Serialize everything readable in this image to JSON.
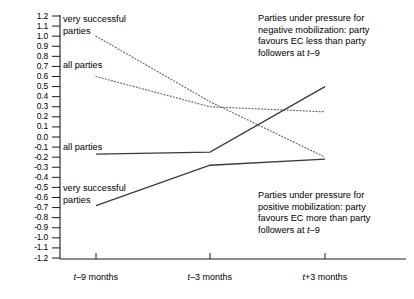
{
  "chart_data": {
    "type": "line",
    "title": "",
    "xlabel": "",
    "ylabel": "",
    "x": [
      "t–9 months",
      "t–3 months",
      "t+3 months"
    ],
    "ylim": [
      -1.2,
      1.2
    ],
    "ytick_step": 0.1,
    "grid": false,
    "legend": "inline-labels",
    "yticks": [
      "1.2",
      "1.1",
      "1.0",
      "0.9",
      "0.8",
      "0.7",
      "0.6",
      "0.5",
      "0.4",
      "0.3",
      "0.2",
      "0.1",
      "0.0",
      "-0.1",
      "-0.2",
      "-0.3",
      "-0.4",
      "-0.5",
      "-0.6",
      "-0.7",
      "-0.8",
      "-0.9",
      "-1.0",
      "-1.1",
      "-1.2"
    ],
    "series": [
      {
        "name": "very successful parties (negative mobilization)",
        "style": "dotted",
        "values": [
          1.0,
          0.35,
          -0.2
        ]
      },
      {
        "name": "all parties (negative mobilization)",
        "style": "dotted",
        "values": [
          0.6,
          0.3,
          0.25
        ]
      },
      {
        "name": "all parties (positive mobilization)",
        "style": "solid",
        "values": [
          -0.17,
          -0.15,
          0.5
        ]
      },
      {
        "name": "very successful parties (positive mobilization)",
        "style": "solid",
        "values": [
          -0.68,
          -0.28,
          -0.22
        ]
      }
    ]
  },
  "axis": {
    "y_labels": [
      "1.2",
      "1.1",
      "1.0",
      "0.9",
      "0.8",
      "0.7",
      "0.6",
      "0.5",
      "0.4",
      "0.3",
      "0.2",
      "0.1",
      "0.0",
      "-0.1",
      "-0.2",
      "-0.3",
      "-0.4",
      "-0.5",
      "-0.6",
      "-0.7",
      "-0.8",
      "-0.9",
      "-1.0",
      "-1.1",
      "-1.2"
    ],
    "x_labels": [
      {
        "prefix": "t",
        "rest": "–9 months"
      },
      {
        "prefix": "t",
        "rest": "–3 months"
      },
      {
        "prefix": "t",
        "rest": "+3 months"
      }
    ]
  },
  "series_labels": {
    "top_very_successful": "very successful\nparties",
    "top_all": "all parties",
    "bottom_all": "all parties",
    "bottom_very_successful": "very successful\nparties"
  },
  "annotations": {
    "negative": {
      "line1": "Parties under pressure for",
      "line2": "negative mobilization: party",
      "line3": "favours EC less than party",
      "line4_pre": "followers at ",
      "line4_italic": "t",
      "line4_post": "–9"
    },
    "positive": {
      "line1": "Parties under pressure for",
      "line2": "positive mobilization: party",
      "line3": "favours EC more than party",
      "line4_pre": "followers at ",
      "line4_italic": "t",
      "line4_post": "–9"
    }
  },
  "colors": {
    "axis": "#1a1a1a",
    "solid_line": "#3a3a3a",
    "dotted_line": "#6b6b6b"
  }
}
